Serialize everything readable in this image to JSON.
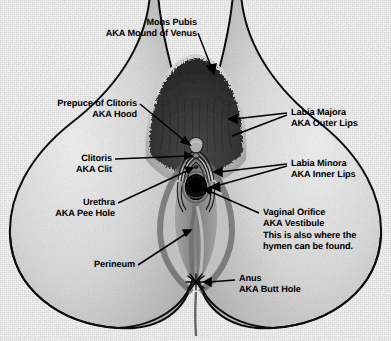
{
  "diagram": {
    "type": "anatomical-illustration",
    "style": "black and white halftone scan on grainy paper",
    "ink_color": "#000000",
    "paper_color": "#fbfbfb",
    "skin_tone": "#d8d8d8",
    "hair_tone": "#3a3a3a"
  },
  "labels": {
    "mons_pubis": "Mons Pubis\nAKA Mound of Venus",
    "prepuce": "Prepuce of Clitoris\nAKA Hood",
    "clitoris": "Clitoris\nAKA Clit",
    "urethra": "Urethra\nAKA Pee Hole",
    "perineum": "Perineum",
    "labia_majora": "Labia Majora\nAKA Outer Lips",
    "labia_minora": "Labia Minora\nAKA Inner Lips",
    "vaginal_orifice": "Vaginal Orifice\nAKA Vestibule\nThis is also where the\nhymen can be found.",
    "anus": "Anus\nAKA Butt Hole"
  }
}
